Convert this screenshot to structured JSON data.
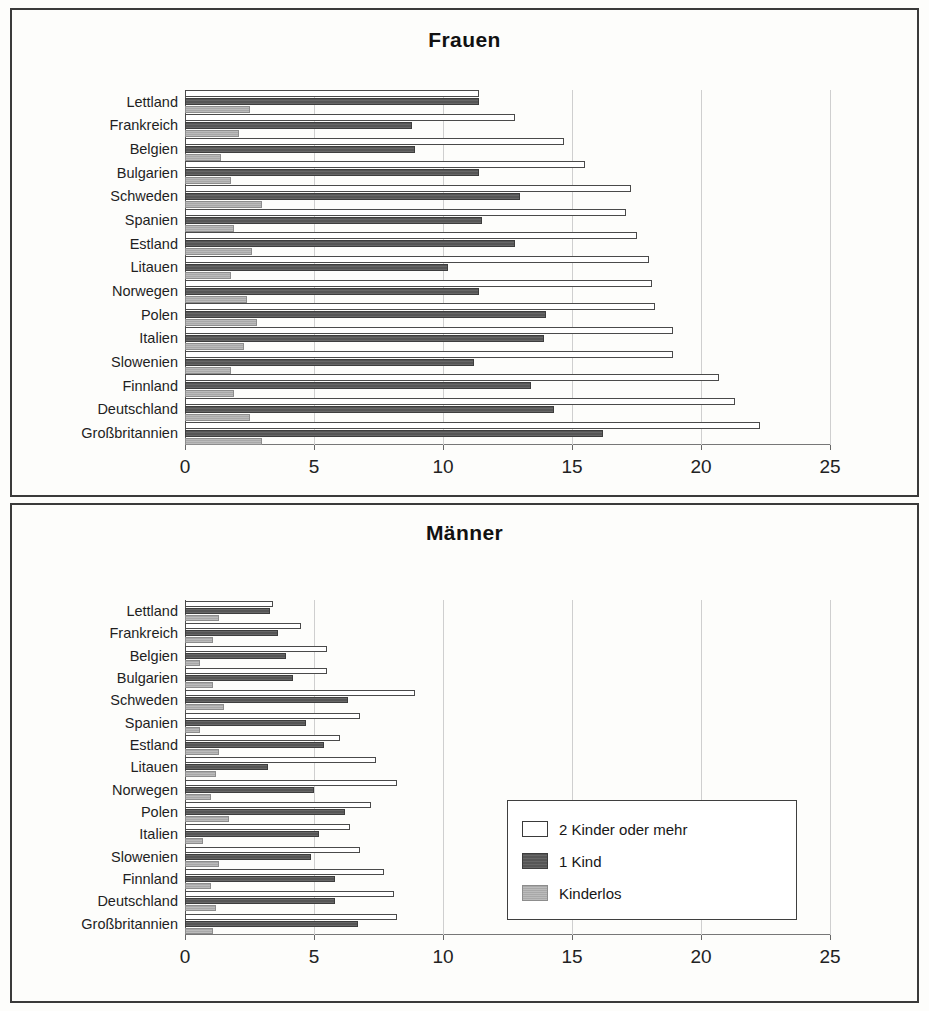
{
  "panels": [
    {
      "id": "frauen",
      "title": "Frauen"
    },
    {
      "id": "maenner",
      "title": "Männer"
    }
  ],
  "legend": {
    "items": [
      {
        "key": "s2plus",
        "label": "2 Kinder oder mehr",
        "color": "#ffffff"
      },
      {
        "key": "s1kind",
        "label": "1 Kind",
        "color": "#565656"
      },
      {
        "key": "skinderlos",
        "label": "Kinderlos",
        "color": "#a8a8a8"
      }
    ]
  },
  "axis": {
    "ticks": [
      "0",
      "5",
      "10",
      "15",
      "20",
      "25"
    ],
    "min": 0,
    "max": 25,
    "step": 5
  },
  "chart_data": [
    {
      "type": "bar",
      "orientation": "horizontal",
      "title": "Frauen",
      "xlabel": "",
      "ylabel": "",
      "xlim": [
        0,
        25
      ],
      "xticks": [
        0,
        5,
        10,
        15,
        20,
        25
      ],
      "grid": true,
      "legend_position": "none",
      "categories": [
        "Lettland",
        "Frankreich",
        "Belgien",
        "Bulgarien",
        "Schweden",
        "Spanien",
        "Estland",
        "Litauen",
        "Norwegen",
        "Polen",
        "Italien",
        "Slowenien",
        "Finnland",
        "Deutschland",
        "Großbritannien"
      ],
      "series": [
        {
          "name": "2 Kinder oder mehr",
          "values": [
            11.4,
            12.8,
            14.7,
            15.5,
            17.3,
            17.1,
            17.5,
            18.0,
            18.1,
            18.2,
            18.9,
            18.9,
            20.7,
            21.3,
            22.3
          ]
        },
        {
          "name": "1 Kind",
          "values": [
            11.4,
            8.8,
            8.9,
            11.4,
            13.0,
            11.5,
            12.8,
            10.2,
            11.4,
            14.0,
            13.9,
            11.2,
            13.4,
            14.3,
            16.2
          ]
        },
        {
          "name": "Kinderlos",
          "values": [
            2.5,
            2.1,
            1.4,
            1.8,
            3.0,
            1.9,
            2.6,
            1.8,
            2.4,
            2.8,
            2.3,
            1.8,
            1.9,
            2.5,
            3.0
          ]
        }
      ]
    },
    {
      "type": "bar",
      "orientation": "horizontal",
      "title": "Männer",
      "xlabel": "",
      "ylabel": "",
      "xlim": [
        0,
        25
      ],
      "xticks": [
        0,
        5,
        10,
        15,
        20,
        25
      ],
      "grid": true,
      "legend_position": "center-right",
      "categories": [
        "Lettland",
        "Frankreich",
        "Belgien",
        "Bulgarien",
        "Schweden",
        "Spanien",
        "Estland",
        "Litauen",
        "Norwegen",
        "Polen",
        "Italien",
        "Slowenien",
        "Finnland",
        "Deutschland",
        "Großbritannien"
      ],
      "series": [
        {
          "name": "2 Kinder oder mehr",
          "values": [
            3.4,
            4.5,
            5.5,
            5.5,
            8.9,
            6.8,
            6.0,
            7.4,
            8.2,
            7.2,
            6.4,
            6.8,
            7.7,
            8.1,
            8.2
          ]
        },
        {
          "name": "1 Kind",
          "values": [
            3.3,
            3.6,
            3.9,
            4.2,
            6.3,
            4.7,
            5.4,
            3.2,
            5.0,
            6.2,
            5.2,
            4.9,
            5.8,
            5.8,
            6.7
          ]
        },
        {
          "name": "Kinderlos",
          "values": [
            1.3,
            1.1,
            0.6,
            1.1,
            1.5,
            0.6,
            1.3,
            1.2,
            1.0,
            1.7,
            0.7,
            1.3,
            1.0,
            1.2,
            1.1
          ]
        }
      ]
    }
  ]
}
